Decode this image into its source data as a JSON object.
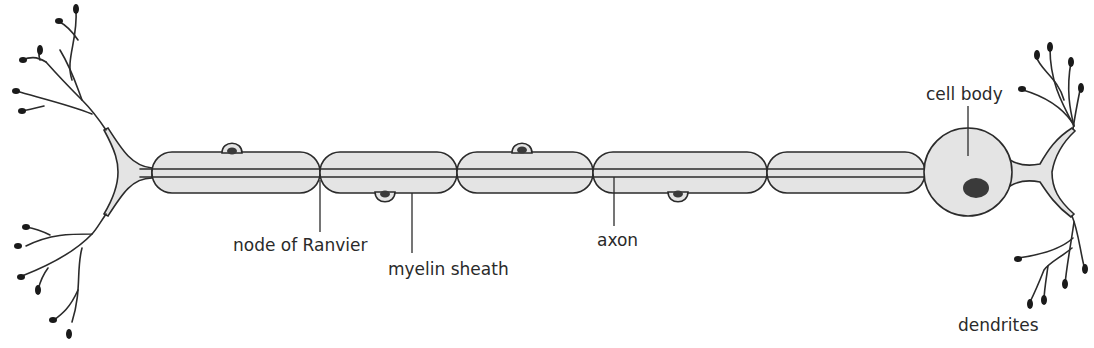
{
  "diagram": {
    "type": "labeled anatomical diagram",
    "colors": {
      "membrane_fill": "#e4e4e4",
      "outline": "#2b2b2b",
      "nucleus": "#3a3a3a",
      "background": "#ffffff"
    },
    "labels": {
      "node_of_ranvier": "node of Ranvier",
      "myelin_sheath": "myelin sheath",
      "axon": "axon",
      "cell_body": "cell body",
      "dendrites": "dendrites"
    },
    "myelin_segments": [
      {
        "x1": 152,
        "x2": 320,
        "bump": "top",
        "bump_x": 232
      },
      {
        "x1": 320,
        "x2": 457,
        "bump": "bottom",
        "bump_x": 385
      },
      {
        "x1": 457,
        "x2": 593,
        "bump": "top",
        "bump_x": 522
      },
      {
        "x1": 593,
        "x2": 767,
        "bump": "bottom",
        "bump_x": 678
      },
      {
        "x1": 767,
        "x2": 925,
        "bump": "none"
      }
    ]
  }
}
